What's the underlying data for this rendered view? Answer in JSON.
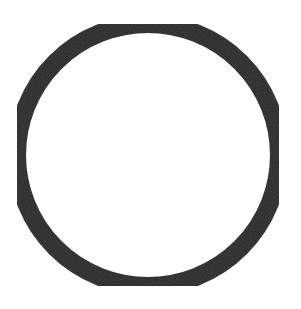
{
  "shape": {
    "type": "ring",
    "center": [
      148,
      155
    ],
    "radius": 131,
    "stroke_width": 18,
    "stroke_color": "#262626",
    "fill_color": "#ffffff"
  },
  "background_color": "#ffffff"
}
